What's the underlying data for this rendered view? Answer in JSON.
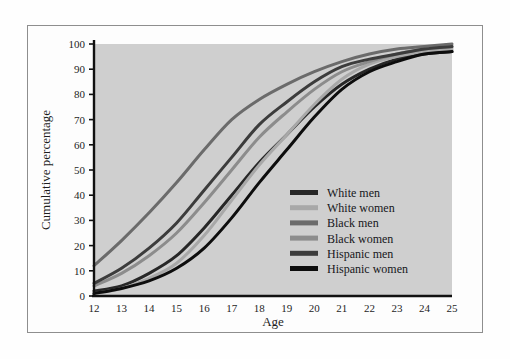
{
  "figure": {
    "frame_border_color": "#8e8e8e",
    "page_background": "#fefefe",
    "plot_background": "#cfcfcf"
  },
  "chart_data": {
    "type": "line",
    "title": "",
    "subtitle": "",
    "xlabel": "Age",
    "ylabel": "Cumulative percentage",
    "xlim": [
      12,
      25
    ],
    "ylim": [
      0,
      100
    ],
    "grid": false,
    "legend_position": "center-right",
    "x": [
      12,
      13,
      14,
      15,
      16,
      17,
      18,
      19,
      20,
      21,
      22,
      23,
      24,
      25
    ],
    "xticks": [
      "12",
      "13",
      "14",
      "15",
      "16",
      "17",
      "18",
      "19",
      "20",
      "21",
      "22",
      "23",
      "24",
      "25"
    ],
    "yticks": [
      "0",
      "10",
      "20",
      "30",
      "40",
      "50",
      "60",
      "70",
      "80",
      "90",
      "100"
    ],
    "series": [
      {
        "name": "White men",
        "color": "#272727",
        "values": [
          2,
          4,
          9,
          16,
          27,
          40,
          53,
          64,
          75,
          84,
          90,
          94,
          96,
          97
        ]
      },
      {
        "name": "White women",
        "color": "#a8a8a8",
        "values": [
          1,
          3,
          7,
          13,
          24,
          38,
          52,
          64,
          76,
          86,
          92,
          95,
          97,
          98
        ]
      },
      {
        "name": "Black men",
        "color": "#6b6b6b",
        "values": [
          12,
          22,
          33,
          45,
          58,
          70,
          78,
          84,
          89,
          93,
          96,
          98,
          99,
          100
        ]
      },
      {
        "name": "Black women",
        "color": "#8c8c8c",
        "values": [
          4,
          9,
          16,
          25,
          37,
          50,
          63,
          73,
          82,
          89,
          93,
          96,
          98,
          99
        ]
      },
      {
        "name": "Hispanic men",
        "color": "#3c3c3c",
        "values": [
          5,
          11,
          19,
          29,
          42,
          55,
          68,
          77,
          85,
          91,
          94,
          96,
          98,
          99
        ]
      },
      {
        "name": "Hispanic women",
        "color": "#0d0d0d",
        "values": [
          1,
          3,
          6,
          11,
          19,
          31,
          45,
          58,
          71,
          82,
          89,
          93,
          96,
          97
        ]
      }
    ]
  },
  "legend": {
    "entries": [
      {
        "label": "White men",
        "swatch": "#272727"
      },
      {
        "label": "White women",
        "swatch": "#a8a8a8"
      },
      {
        "label": "Black men",
        "swatch": "#6b6b6b"
      },
      {
        "label": "Black women",
        "swatch": "#8c8c8c"
      },
      {
        "label": "Hispanic men",
        "swatch": "#3c3c3c"
      },
      {
        "label": "Hispanic women",
        "swatch": "#0d0d0d"
      }
    ]
  }
}
